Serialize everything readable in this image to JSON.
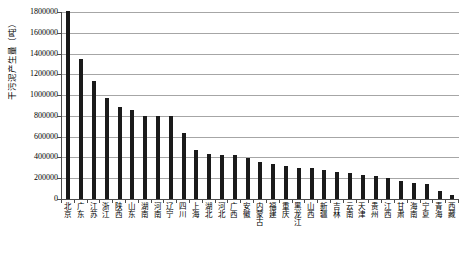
{
  "chart_data": {
    "type": "bar",
    "title": "",
    "subtitle": "",
    "xlabel": "",
    "ylabel": "干污泥产生量（吨）",
    "ylim": [
      0,
      1800000
    ],
    "ytick_values": [
      0,
      200000,
      400000,
      600000,
      800000,
      1000000,
      1200000,
      1400000,
      1600000,
      1800000
    ],
    "ytick_labels": [
      "0",
      "200000",
      "400000",
      "600000",
      "800000",
      "1000000",
      "1200000",
      "1400000",
      "1600000",
      "1800000"
    ],
    "grid": true,
    "legend": false,
    "legend_position": "none",
    "bar_color": "#1a1a1a",
    "categories": [
      "北京",
      "广东",
      "江苏",
      "浙江",
      "陕西",
      "山东",
      "湖南",
      "河南",
      "辽宁",
      "四川",
      "上海",
      "湖北",
      "河北",
      "广西",
      "安徽",
      "内蒙古",
      "福建",
      "重庆",
      "黑龙江",
      "山西",
      "新疆",
      "吉林",
      "云南",
      "天津",
      "贵州",
      "江西",
      "甘肃",
      "海南",
      "宁夏",
      "青海",
      "西藏"
    ],
    "values": [
      1810000,
      1345000,
      1140000,
      970000,
      885000,
      855000,
      800000,
      800000,
      800000,
      640000,
      470000,
      430000,
      425000,
      420000,
      395000,
      360000,
      340000,
      320000,
      300000,
      295000,
      275000,
      260000,
      255000,
      235000,
      220000,
      205000,
      170000,
      155000,
      145000,
      75000,
      35000
    ],
    "series": [
      {
        "name": "干污泥产生量",
        "values": [
          1810000,
          1345000,
          1140000,
          970000,
          885000,
          855000,
          800000,
          800000,
          800000,
          640000,
          470000,
          430000,
          425000,
          420000,
          395000,
          360000,
          340000,
          320000,
          300000,
          295000,
          275000,
          260000,
          255000,
          235000,
          220000,
          205000,
          170000,
          155000,
          145000,
          75000,
          35000
        ]
      }
    ]
  }
}
